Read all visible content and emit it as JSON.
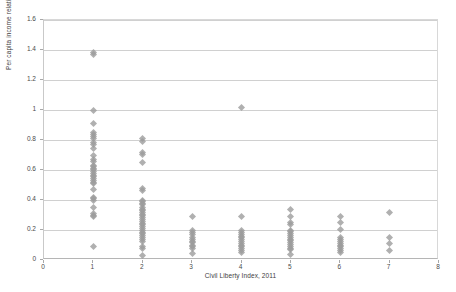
{
  "chart_data": {
    "type": "scatter",
    "title": "",
    "xlabel": "Civil Liberty Index, 2011",
    "ylabel": "Per capita income relative to the US, 2011",
    "xlim": [
      0,
      8
    ],
    "ylim": [
      0,
      1.6
    ],
    "xticks": [
      "0",
      "1",
      "2",
      "3",
      "4",
      "5",
      "6",
      "7",
      "8"
    ],
    "xtick_values": [
      0,
      1,
      2,
      3,
      4,
      5,
      6,
      7,
      8
    ],
    "yticks": [
      "0",
      "0.2",
      "0.4",
      "0.6",
      "0.8",
      "1",
      "1.2",
      "1.4",
      "1.6"
    ],
    "ytick_values": [
      0,
      0.2,
      0.4,
      0.6,
      0.8,
      1.0,
      1.2,
      1.4,
      1.6
    ],
    "grid": "horizontal",
    "legend": "none",
    "marker": "diamond",
    "marker_color": "#9c9c9c",
    "series": [
      {
        "name": "Countries",
        "points": [
          [
            1,
            1.385
          ],
          [
            1,
            1.368
          ],
          [
            1,
            0.998
          ],
          [
            1,
            0.907
          ],
          [
            1,
            0.848
          ],
          [
            1,
            0.836
          ],
          [
            1,
            0.822
          ],
          [
            1,
            0.808
          ],
          [
            1,
            0.782
          ],
          [
            1,
            0.77
          ],
          [
            1,
            0.742
          ],
          [
            1,
            0.7
          ],
          [
            1,
            0.672
          ],
          [
            1,
            0.66
          ],
          [
            1,
            0.632
          ],
          [
            1,
            0.622
          ],
          [
            1,
            0.612
          ],
          [
            1,
            0.602
          ],
          [
            1,
            0.59
          ],
          [
            1,
            0.578
          ],
          [
            1,
            0.566
          ],
          [
            1,
            0.556
          ],
          [
            1,
            0.544
          ],
          [
            1,
            0.532
          ],
          [
            1,
            0.52
          ],
          [
            1,
            0.508
          ],
          [
            1,
            0.47
          ],
          [
            1,
            0.42
          ],
          [
            1,
            0.408
          ],
          [
            1,
            0.398
          ],
          [
            1,
            0.352
          ],
          [
            1,
            0.312
          ],
          [
            1,
            0.3
          ],
          [
            1,
            0.288
          ],
          [
            1,
            0.092
          ],
          [
            2,
            0.808
          ],
          [
            2,
            0.792
          ],
          [
            2,
            0.718
          ],
          [
            2,
            0.706
          ],
          [
            2,
            0.652
          ],
          [
            2,
            0.478
          ],
          [
            2,
            0.462
          ],
          [
            2,
            0.4
          ],
          [
            2,
            0.39
          ],
          [
            2,
            0.38
          ],
          [
            2,
            0.368
          ],
          [
            2,
            0.352
          ],
          [
            2,
            0.34
          ],
          [
            2,
            0.33
          ],
          [
            2,
            0.318
          ],
          [
            2,
            0.306
          ],
          [
            2,
            0.294
          ],
          [
            2,
            0.282
          ],
          [
            2,
            0.27
          ],
          [
            2,
            0.258
          ],
          [
            2,
            0.246
          ],
          [
            2,
            0.234
          ],
          [
            2,
            0.222
          ],
          [
            2,
            0.21
          ],
          [
            2,
            0.198
          ],
          [
            2,
            0.186
          ],
          [
            2,
            0.174
          ],
          [
            2,
            0.162
          ],
          [
            2,
            0.148
          ],
          [
            2,
            0.136
          ],
          [
            2,
            0.122
          ],
          [
            2,
            0.09
          ],
          [
            2,
            0.078
          ],
          [
            2,
            0.03
          ],
          [
            3,
            0.29
          ],
          [
            3,
            0.196
          ],
          [
            3,
            0.182
          ],
          [
            3,
            0.17
          ],
          [
            3,
            0.15
          ],
          [
            3,
            0.138
          ],
          [
            3,
            0.126
          ],
          [
            3,
            0.114
          ],
          [
            3,
            0.1
          ],
          [
            3,
            0.088
          ],
          [
            3,
            0.076
          ],
          [
            3,
            0.042
          ],
          [
            4,
            1.02
          ],
          [
            4,
            0.29
          ],
          [
            4,
            0.196
          ],
          [
            4,
            0.184
          ],
          [
            4,
            0.172
          ],
          [
            4,
            0.16
          ],
          [
            4,
            0.148
          ],
          [
            4,
            0.136
          ],
          [
            4,
            0.124
          ],
          [
            4,
            0.112
          ],
          [
            4,
            0.1
          ],
          [
            4,
            0.088
          ],
          [
            4,
            0.076
          ],
          [
            4,
            0.064
          ],
          [
            4,
            0.048
          ],
          [
            5,
            0.34
          ],
          [
            5,
            0.29
          ],
          [
            5,
            0.248
          ],
          [
            5,
            0.236
          ],
          [
            5,
            0.2
          ],
          [
            5,
            0.188
          ],
          [
            5,
            0.176
          ],
          [
            5,
            0.164
          ],
          [
            5,
            0.152
          ],
          [
            5,
            0.14
          ],
          [
            5,
            0.128
          ],
          [
            5,
            0.116
          ],
          [
            5,
            0.104
          ],
          [
            5,
            0.092
          ],
          [
            5,
            0.08
          ],
          [
            5,
            0.068
          ],
          [
            5,
            0.034
          ],
          [
            6,
            0.288
          ],
          [
            6,
            0.248
          ],
          [
            6,
            0.204
          ],
          [
            6,
            0.148
          ],
          [
            6,
            0.136
          ],
          [
            6,
            0.124
          ],
          [
            6,
            0.112
          ],
          [
            6,
            0.1
          ],
          [
            6,
            0.088
          ],
          [
            6,
            0.076
          ],
          [
            6,
            0.064
          ],
          [
            6,
            0.052
          ],
          [
            7,
            0.316
          ],
          [
            7,
            0.15
          ],
          [
            7,
            0.11
          ],
          [
            7,
            0.062
          ]
        ]
      }
    ]
  }
}
